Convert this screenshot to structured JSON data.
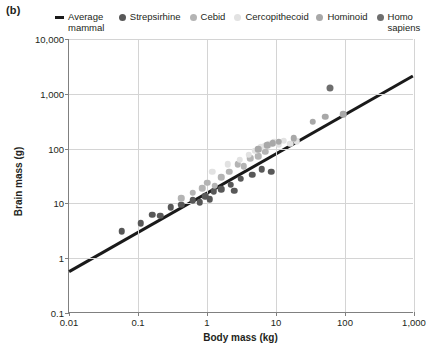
{
  "panel": {
    "label": "(b)"
  },
  "legend": {
    "items": [
      {
        "label": "Average mammal",
        "marker": "line",
        "color": "#1a1a1a"
      },
      {
        "label": "Strepsirhine",
        "marker": "circle",
        "color": "#585858"
      },
      {
        "label": "Cebid",
        "marker": "circle",
        "color": "#b4b4b4"
      },
      {
        "label": "Cercopithecoid",
        "marker": "circle",
        "color": "#e2e2e2"
      },
      {
        "label": "Hominoid",
        "marker": "circle",
        "color": "#a8a8a8"
      },
      {
        "label": "Homo sapiens",
        "marker": "circle",
        "color": "#6e6e6e"
      }
    ]
  },
  "chart_data": {
    "type": "scatter",
    "title": "",
    "xlabel": "Body mass (kg)",
    "ylabel": "Brain mass (g)",
    "xscale": "log",
    "yscale": "log",
    "xlim": [
      0.01,
      1000
    ],
    "ylim": [
      0.1,
      10000
    ],
    "xticks": [
      0.01,
      0.1,
      1,
      10,
      100,
      1000
    ],
    "xticklabels": [
      "0.01",
      "0.1",
      "1",
      "10",
      "100",
      "1,000"
    ],
    "yticks": [
      0.1,
      1,
      10,
      100,
      1000,
      10000
    ],
    "yticklabels": [
      "0.1",
      "1",
      "10",
      "100",
      "1,000",
      "10,000"
    ],
    "grid": true,
    "legend_position": "top",
    "series": [
      {
        "name": "Average mammal",
        "type": "line",
        "color": "#1a1a1a",
        "points": [
          [
            0.01,
            0.55
          ],
          [
            1000,
            2100
          ]
        ]
      },
      {
        "name": "Strepsirhine",
        "type": "scatter",
        "color": "#585858",
        "points": [
          [
            0.058,
            3.1
          ],
          [
            0.11,
            4.3
          ],
          [
            0.16,
            6.2
          ],
          [
            0.21,
            6.0
          ],
          [
            0.3,
            8.5
          ],
          [
            0.42,
            9.5
          ],
          [
            0.62,
            11.5
          ],
          [
            0.78,
            10.5
          ],
          [
            0.95,
            13.5
          ],
          [
            1.1,
            12.0
          ],
          [
            1.25,
            16.5
          ],
          [
            1.6,
            18.0
          ],
          [
            2.2,
            22.0
          ],
          [
            2.5,
            17.0
          ],
          [
            3.1,
            28.0
          ],
          [
            4.5,
            33.0
          ],
          [
            6.2,
            42.0
          ],
          [
            8.5,
            38.0
          ]
        ]
      },
      {
        "name": "Cebid",
        "type": "scatter",
        "color": "#b4b4b4",
        "points": [
          [
            0.42,
            12.5
          ],
          [
            0.62,
            15.5
          ],
          [
            0.85,
            19.0
          ],
          [
            1.0,
            24.0
          ],
          [
            1.3,
            21.0
          ],
          [
            1.6,
            30.0
          ],
          [
            2.1,
            38.0
          ],
          [
            2.8,
            52.0
          ],
          [
            3.4,
            48.0
          ],
          [
            4.2,
            66.0
          ],
          [
            5.5,
            72.0
          ],
          [
            7.0,
            88.0
          ]
        ]
      },
      {
        "name": "Cercopithecoid",
        "type": "scatter",
        "color": "#e2e2e2",
        "points": [
          [
            1.2,
            38.0
          ],
          [
            2.0,
            52.0
          ],
          [
            3.0,
            62.0
          ],
          [
            4.0,
            78.0
          ],
          [
            5.0,
            92.0
          ],
          [
            6.0,
            105.0
          ],
          [
            7.0,
            112.0
          ],
          [
            8.0,
            120.0
          ],
          [
            9.5,
            130.0
          ],
          [
            11.0,
            118.0
          ],
          [
            13.0,
            140.0
          ],
          [
            16.0,
            122.0
          ],
          [
            20.0,
            135.0
          ]
        ]
      },
      {
        "name": "Hominoid",
        "type": "scatter",
        "color": "#a8a8a8",
        "points": [
          [
            5.5,
            98.0
          ],
          [
            7.5,
            115.0
          ],
          [
            9.0,
            125.0
          ],
          [
            11.0,
            132.0
          ],
          [
            18.0,
            155.0
          ],
          [
            34.0,
            310.0
          ],
          [
            52.0,
            385.0
          ],
          [
            95.0,
            420.0
          ]
        ]
      },
      {
        "name": "Homo sapiens",
        "type": "scatter",
        "color": "#6e6e6e",
        "points": [
          [
            60.0,
            1300.0
          ]
        ]
      }
    ]
  }
}
